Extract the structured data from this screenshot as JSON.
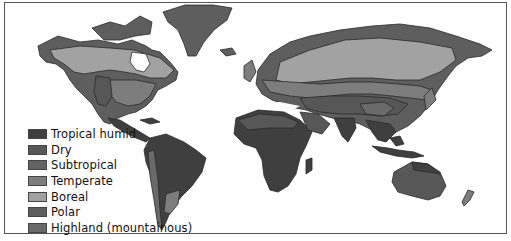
{
  "map": {
    "type": "world-climate-zones",
    "projection": "world outline (Greenland top, Antarctica omitted)",
    "colors": {
      "background": "#ffffff",
      "border": "#555555",
      "tropical_humid": "#3f3f3f",
      "dry": "#575757",
      "subtropical": "#636363",
      "temperate": "#7d7d7d",
      "boreal": "#a2a2a2",
      "polar": "#5e5e5e",
      "highland": "#6a6a6a"
    }
  },
  "legend": {
    "items": [
      {
        "label": "Tropical humid",
        "color": "#3f3f3f"
      },
      {
        "label": "Dry",
        "color": "#575757"
      },
      {
        "label": "Subtropical",
        "color": "#636363"
      },
      {
        "label": "Temperate",
        "color": "#7d7d7d"
      },
      {
        "label": "Boreal",
        "color": "#a2a2a2"
      },
      {
        "label": "Polar",
        "color": "#5e5e5e"
      },
      {
        "label": "Highland (mountainous)",
        "color": "#6a6a6a"
      }
    ]
  }
}
